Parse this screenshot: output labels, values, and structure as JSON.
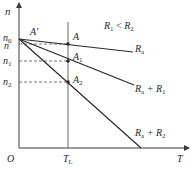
{
  "diagram": {
    "type": "motor-mechanical-characteristic",
    "axes": {
      "y_label": "n",
      "x_label": "T",
      "origin_label": "O"
    },
    "condition_label": {
      "main": "R",
      "sub1": "1",
      "rel": " < ",
      "main2": "R",
      "sub2": "2"
    },
    "y_ticks": [
      {
        "label": "n",
        "sub": "0",
        "y": 39
      },
      {
        "label": "n",
        "sub": "",
        "y": 44
      },
      {
        "label": "n",
        "sub": "1",
        "y": 61
      },
      {
        "label": "n",
        "sub": "2",
        "y": 82
      }
    ],
    "x_ticks": [
      {
        "label": "T",
        "sub": "L",
        "x": 68
      }
    ],
    "points": [
      {
        "label": "A'",
        "sub": ""
      },
      {
        "label": "A",
        "sub": ""
      },
      {
        "label": "A",
        "sub": "1"
      },
      {
        "label": "A",
        "sub": "2"
      }
    ],
    "lines": [
      {
        "name": "R",
        "sub": "a",
        "extra": ""
      },
      {
        "name": "R",
        "sub": "a",
        "extra": " + R",
        "extra_sub": "1"
      },
      {
        "name": "R",
        "sub": "a",
        "extra": " + R",
        "extra_sub": "2"
      }
    ],
    "colors": {
      "line": "#2a2a2a",
      "axis": "#3a3a3a",
      "dash": "#555555"
    }
  }
}
